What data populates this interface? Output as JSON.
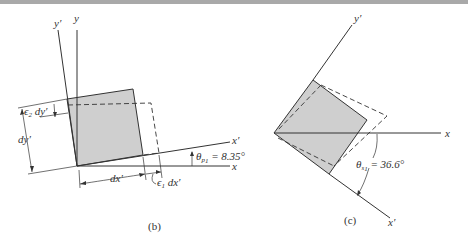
{
  "figure_b": {
    "caption": "(b)",
    "axis_y": "y",
    "axis_y_prime": "y′",
    "axis_x": "x",
    "axis_x_prime": "x′",
    "label_dy": "dy′",
    "label_dx": "dx′",
    "label_e2": "ϵ",
    "label_e2_sub": "2",
    "label_e2_rest": " dy′",
    "label_e1": "ϵ",
    "label_e1_sub": "1",
    "label_e1_rest": " dx′",
    "angle_symbol": "θ",
    "angle_sub": "p",
    "angle_sub2": "1",
    "angle_value": " = 8.35°"
  },
  "figure_c": {
    "caption": "(c)",
    "axis_y_prime": "y′",
    "axis_x": "x",
    "axis_x_prime": "x′",
    "angle_symbol": "θ",
    "angle_sub": "s",
    "angle_sub2": "1",
    "angle_value": " = 36.6°"
  },
  "colors": {
    "element_fill": "#cfcfcf",
    "line": "#333333",
    "top_bar": "#a9a9a9"
  }
}
